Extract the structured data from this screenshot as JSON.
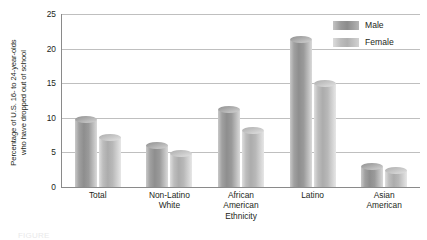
{
  "chart_data": {
    "type": "bar",
    "title": "",
    "xlabel": "Ethnicity",
    "ylabel": "Percentage of U.S. 16- to 24-year-olds\nwho have dropped out of school",
    "categories": [
      "Total",
      "Non-Latino\nWhite",
      "African\nAmerican",
      "Latino",
      "Asian\nAmerican"
    ],
    "series": [
      {
        "name": "Male",
        "values": [
          9.7,
          6.0,
          11.2,
          21.3,
          2.9
        ],
        "color": "#9a9a9a"
      },
      {
        "name": "Female",
        "values": [
          7.2,
          4.8,
          8.1,
          15.0,
          2.4
        ],
        "color": "#c4c4c4"
      }
    ],
    "ylim": [
      0,
      25
    ],
    "yticks": [
      0,
      5,
      10,
      15,
      20,
      25
    ],
    "ytick_labels": [
      "0",
      "5",
      "10",
      "15",
      "20",
      "25"
    ],
    "grid": true,
    "legend_position": "top-right"
  },
  "legend": {
    "items": [
      {
        "label": "Male"
      },
      {
        "label": "Female"
      }
    ]
  },
  "caption": {
    "text": "FIGURE"
  }
}
